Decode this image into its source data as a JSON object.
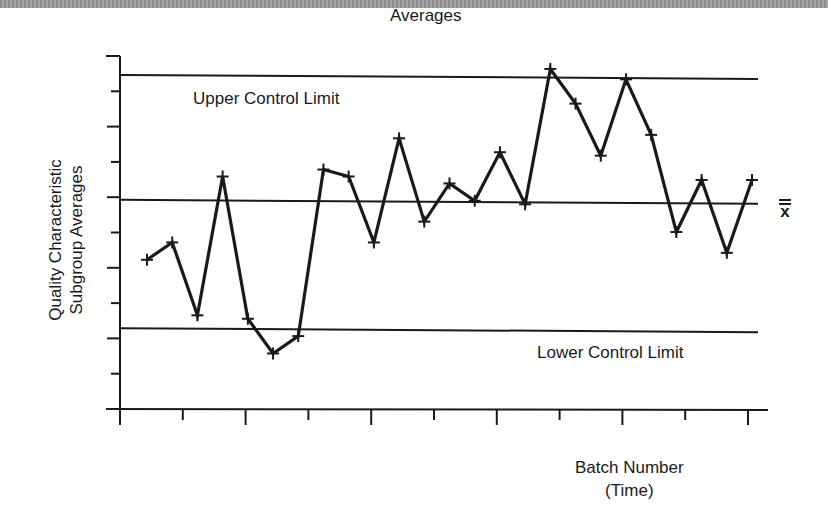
{
  "chart_data": {
    "type": "line",
    "title": "Averages",
    "xlabel": "Batch Number (Time)",
    "xlabel_lines": [
      "Batch Number",
      "(Time)"
    ],
    "ylabel": "Quality Characteristic Subgroup Averages",
    "ylabel_lines": [
      "Quality Characteristic",
      "Subgroup Averages"
    ],
    "x": [
      1,
      2,
      3,
      4,
      5,
      6,
      7,
      8,
      9,
      10,
      11,
      12,
      13,
      14,
      15,
      16,
      17,
      18,
      19,
      20,
      21,
      22,
      23,
      24,
      25
    ],
    "series": [
      {
        "name": "Subgroup Averages",
        "marker": "+",
        "values": [
          4.3,
          4.8,
          2.7,
          6.7,
          2.6,
          1.6,
          2.1,
          6.9,
          6.7,
          4.8,
          7.8,
          5.4,
          6.5,
          6.0,
          7.4,
          5.9,
          9.8,
          8.8,
          7.3,
          9.5,
          7.9,
          5.1,
          6.6,
          4.5,
          6.6
        ]
      }
    ],
    "reference_lines": [
      {
        "name": "Upper Control Limit",
        "label": "Upper Control Limit",
        "value": 9.6
      },
      {
        "name": "Center Line",
        "label": "x̿",
        "value": 6.0
      },
      {
        "name": "Lower Control Limit",
        "label": "Lower Control Limit",
        "value": 2.3
      }
    ],
    "y_ticks_count": 11,
    "x_ticks_count": 11,
    "ylim": [
      0,
      10
    ],
    "xlim": [
      0,
      25.5
    ],
    "tick_labels": "none",
    "grid": false,
    "legend": "none"
  },
  "labels": {
    "title": "Averages",
    "ucl": "Upper Control Limit",
    "lcl": "Lower Control Limit",
    "center_symbol": "x",
    "xlabel_line1": "Batch Number",
    "xlabel_line2": "(Time)",
    "ylabel_line1": "Quality Characteristic",
    "ylabel_line2": "Subgroup Averages"
  },
  "colors": {
    "ink": "#1a1a1a",
    "background": "#ffffff"
  }
}
